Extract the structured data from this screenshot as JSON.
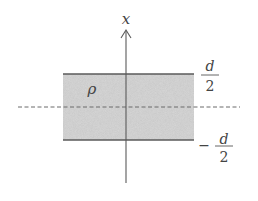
{
  "diagram": {
    "type": "charged slab cross-section",
    "axis_label": "x",
    "density_label": "ρ",
    "top_label": {
      "numerator": "d",
      "denominator": "2",
      "sign": ""
    },
    "bottom_label": {
      "numerator": "d",
      "denominator": "2",
      "sign": "−"
    },
    "colors": {
      "slab_fill": "#d9d9d9",
      "edge": "#555555",
      "axis": "#555555",
      "dashed": "#777777",
      "text": "#444444"
    }
  }
}
